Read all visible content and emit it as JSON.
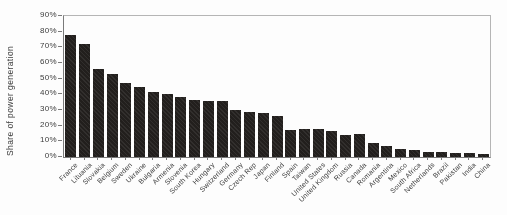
{
  "figure": {
    "background": "#fdfdfd",
    "bar_color": "#221f1d",
    "axis_color": "#7a7a7a",
    "frame_color": "#b5b5b5",
    "text_color": "#3c3c3c"
  },
  "chart_data": {
    "type": "bar",
    "title": "",
    "xlabel": "",
    "ylabel": "Share of power generation",
    "ylim": [
      0,
      90
    ],
    "yticks": [
      0,
      10,
      20,
      30,
      40,
      50,
      60,
      70,
      80,
      90
    ],
    "ytick_suffix": "%",
    "grid": false,
    "legend": null,
    "categories": [
      "France",
      "Lituania",
      "Slovakia",
      "Belgium",
      "Sweden",
      "Ukraine",
      "Bulgaria",
      "Armenia",
      "Slovenia",
      "South Korea",
      "Hungary",
      "Switzerland",
      "Germany",
      "Czech Rep",
      "Japan",
      "Finland",
      "Spain",
      "Taiwan",
      "United States",
      "United Kingdom",
      "Russia",
      "Canada",
      "Romania",
      "Argentina",
      "Mexico",
      "South Africa",
      "Netherlands",
      "Brazil",
      "Pakistan",
      "India",
      "China"
    ],
    "values": [
      78,
      72,
      56,
      53,
      47,
      45,
      41.5,
      40,
      38.5,
      36.5,
      35.5,
      35.5,
      30,
      29,
      28,
      26,
      17.3,
      18,
      18,
      16.5,
      14,
      15,
      8.8,
      6.8,
      5,
      4.6,
      3.4,
      3.2,
      2.6,
      2.5,
      1.8
    ]
  }
}
